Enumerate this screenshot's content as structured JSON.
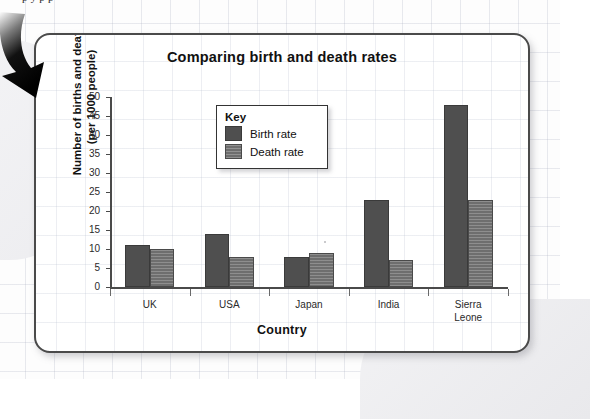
{
  "page": {
    "top_cut_text": "p    y                                                         p  p"
  },
  "callout": {
    "arrow_icon": "curved-down-arrow"
  },
  "chart_data": {
    "type": "bar",
    "title": "Comparing birth and death rates",
    "xlabel": "Country",
    "ylabel": "Number of births and deaths (per 1000 people)",
    "ylabel_lines": [
      "Number of births and deaths",
      "(per 1000 people)"
    ],
    "categories": [
      "UK",
      "USA",
      "Japan",
      "India",
      "Sierra Leone"
    ],
    "category_label_lines": [
      [
        "UK"
      ],
      [
        "USA"
      ],
      [
        "Japan"
      ],
      [
        "India"
      ],
      [
        "Sierra",
        "Leone"
      ]
    ],
    "series": [
      {
        "name": "Birth rate",
        "values": [
          11,
          14,
          8,
          23,
          48
        ],
        "color": "#4f4f4f"
      },
      {
        "name": "Death rate",
        "values": [
          10,
          8,
          9,
          7,
          23
        ],
        "color": "#6e6e6e"
      }
    ],
    "ylim": [
      0,
      50
    ],
    "ytick_step": 5,
    "yticks": [
      0,
      5,
      10,
      15,
      20,
      25,
      30,
      35,
      40,
      45,
      50
    ],
    "ytick_labels": [
      "0",
      "5",
      "10",
      "15",
      "20",
      "25",
      "30",
      "35",
      "40",
      "45",
      "50"
    ],
    "grid": true,
    "legend_position": "upper-center-left",
    "legend_title": "Key"
  }
}
